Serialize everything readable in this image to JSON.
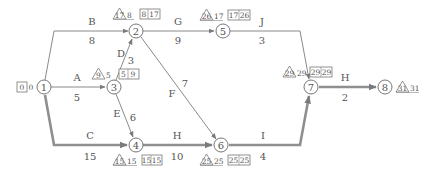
{
  "diagram": {
    "type": "arrow-network-schedule",
    "nodes": [
      {
        "id": "1"
      },
      {
        "id": "2"
      },
      {
        "id": "3"
      },
      {
        "id": "4"
      },
      {
        "id": "5"
      },
      {
        "id": "6"
      },
      {
        "id": "7"
      },
      {
        "id": "8"
      }
    ],
    "edges": [
      {
        "name": "A",
        "duration": "5",
        "from": "1",
        "to": "3",
        "critical": false
      },
      {
        "name": "B",
        "duration": "8",
        "from": "1",
        "to": "2",
        "critical": false
      },
      {
        "name": "C",
        "duration": "15",
        "from": "1",
        "to": "4",
        "critical": true
      },
      {
        "name": "D",
        "duration": "3",
        "from": "3",
        "to": "2",
        "critical": false
      },
      {
        "name": "E",
        "duration": "6",
        "from": "3",
        "to": "4",
        "critical": false
      },
      {
        "name": "F",
        "duration": "7",
        "from": "2",
        "to": "6",
        "critical": false
      },
      {
        "name": "G",
        "duration": "9",
        "from": "2",
        "to": "5",
        "critical": false
      },
      {
        "name": "H",
        "duration": "10",
        "from": "4",
        "to": "6",
        "critical": true
      },
      {
        "name": "I",
        "duration": "4",
        "from": "6",
        "to": "7",
        "critical": true
      },
      {
        "name": "J",
        "duration": "3",
        "from": "5",
        "to": "7",
        "critical": false
      },
      {
        "name": "H",
        "duration": "2",
        "from": "7",
        "to": "8",
        "critical": true
      }
    ],
    "annotations": {
      "n1": {
        "box_a": "0",
        "box_b": "0"
      },
      "n2": {
        "tri": "17",
        "tri_val": "8",
        "box_a": "8",
        "box_b": "17"
      },
      "n3": {
        "tri": "9",
        "tri_val": "5",
        "box_a": "5",
        "box_b": "9"
      },
      "n4": {
        "tri": "15",
        "tri_val": "15",
        "box_a": "15",
        "box_b": "15"
      },
      "n5": {
        "tri": "26",
        "tri_val": "17",
        "box_a": "17",
        "box_b": "26"
      },
      "n6": {
        "tri": "25",
        "tri_val": "25",
        "box_a": "25",
        "box_b": "25"
      },
      "n7": {
        "tri": "29",
        "tri_val": "29",
        "box_a": "29",
        "box_b": "29"
      },
      "n8": {
        "tri": "31",
        "tri_val": "31"
      }
    },
    "colors": {
      "line": "#8a8a8a",
      "critical_line": "#8f8f8f",
      "text": "#555555"
    }
  }
}
